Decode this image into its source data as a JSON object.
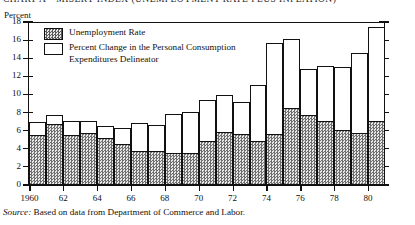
{
  "chart_title": "CHART A—MISERY INDEX (UNEMPLOYMENT RATE PLUS INFLATION)",
  "y_unit_label": "Percent",
  "legend": {
    "items": [
      {
        "swatch": "dotted-pattern-swatch",
        "label": "Unemployment Rate"
      },
      {
        "swatch": "open-white-swatch",
        "label": "Percent Change in the Personal Consumption\nExpenditures Delineator"
      }
    ]
  },
  "source": {
    "prefix": "Source:",
    "text": " Based on data from Department of Commerce and Labor."
  },
  "chart_data": {
    "type": "bar",
    "stacked": true,
    "title": "CHART A—MISERY INDEX (UNEMPLOYMENT RATE PLUS INFLATION)",
    "xlabel": "",
    "ylabel": "Percent",
    "ylim": [
      0,
      18
    ],
    "ytick_labels": [
      "0",
      "2",
      "4",
      "6",
      "8",
      "10",
      "12",
      "14",
      "16",
      "18"
    ],
    "yticks": [
      0,
      2,
      4,
      6,
      8,
      10,
      12,
      14,
      16,
      18
    ],
    "grid": false,
    "legend_position": "upper-left-inside",
    "categories": [
      "1960",
      "1961",
      "1962",
      "1963",
      "1964",
      "1965",
      "1966",
      "1967",
      "1968",
      "1969",
      "1970",
      "1971",
      "1972",
      "1973",
      "1974",
      "1975",
      "1976",
      "1977",
      "1978",
      "1979",
      "1980"
    ],
    "xtick_labels": [
      "1960",
      "62",
      "64",
      "66",
      "68",
      "70",
      "72",
      "74",
      "76",
      "78",
      "80"
    ],
    "xtick_categories": [
      "1960",
      "1962",
      "1964",
      "1966",
      "1968",
      "1970",
      "1972",
      "1974",
      "1976",
      "1978",
      "1980"
    ],
    "series": [
      {
        "name": "Unemployment Rate",
        "fill": "dotted-pattern",
        "values": [
          5.5,
          6.7,
          5.5,
          5.7,
          5.2,
          4.5,
          3.8,
          3.8,
          3.6,
          3.5,
          4.9,
          5.9,
          5.6,
          4.9,
          5.6,
          8.5,
          7.7,
          7.1,
          6.1,
          5.8,
          7.1
        ]
      },
      {
        "name": "Percent Change in the Personal Consumption Expenditures Delineator",
        "fill": "white-open",
        "values": [
          1.5,
          1.0,
          1.6,
          1.4,
          1.3,
          1.8,
          3.0,
          2.8,
          4.2,
          4.6,
          4.5,
          4.0,
          3.6,
          6.1,
          10.1,
          7.6,
          5.1,
          6.0,
          6.9,
          8.8,
          10.4
        ]
      }
    ],
    "totals": [
      7.0,
      7.7,
      7.1,
      7.1,
      6.5,
      6.3,
      6.8,
      6.6,
      7.8,
      8.1,
      9.4,
      9.9,
      9.2,
      11.0,
      15.7,
      16.1,
      12.8,
      13.1,
      13.0,
      14.6,
      17.5
    ]
  }
}
